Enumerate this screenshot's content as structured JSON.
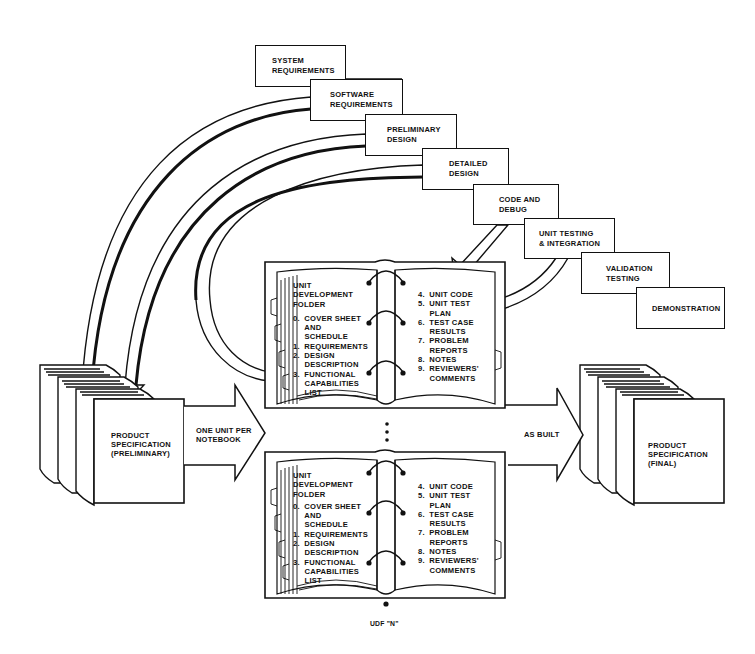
{
  "phases": [
    {
      "id": "system-requirements",
      "line1": "SYSTEM",
      "line2": "REQUIREMENTS"
    },
    {
      "id": "software-requirements",
      "line1": "SOFTWARE",
      "line2": "REQUIREMENTS"
    },
    {
      "id": "preliminary-design",
      "line1": "PRELIMINARY",
      "line2": "DESIGN"
    },
    {
      "id": "detailed-design",
      "line1": "DETAILED",
      "line2": "DESIGN"
    },
    {
      "id": "code-and-debug",
      "line1": "CODE AND",
      "line2": "DEBUG"
    },
    {
      "id": "unit-testing-integration",
      "line1": "UNIT TESTING",
      "line2": "& INTEGRATION"
    },
    {
      "id": "validation-testing",
      "line1": "VALIDATION",
      "line2": "TESTING"
    },
    {
      "id": "demonstration",
      "line1": "DEMONSTRATION",
      "line2": ""
    }
  ],
  "product_spec_preliminary": {
    "line1": "PRODUCT",
    "line2": "SPECIFICATION",
    "line3": "(PRELIMINARY)"
  },
  "product_spec_final": {
    "line1": "PRODUCT",
    "line2": "SPECIFICATION",
    "line3": "(FINAL)"
  },
  "arrows": {
    "left_label_line1": "ONE UNIT PER",
    "left_label_line2": "NOTEBOOK",
    "right_label": "AS BUILT"
  },
  "udf": {
    "title_lines": [
      "UNIT",
      "DEVELOPMENT",
      "FOLDER"
    ],
    "left_items": [
      "0.  COVER SHEET",
      "     AND",
      "     SCHEDULE",
      "1.  REQUIREMENTS",
      "2.  DESIGN",
      "     DESCRIPTION",
      "3.  FUNCTIONAL",
      "     CAPABILITIES",
      "     LIST"
    ],
    "right_items": [
      "4.  UNIT CODE",
      "5.  UNIT TEST",
      "     PLAN",
      "6.  TEST CASE",
      "     RESULTS",
      "7.  PROBLEM",
      "     REPORTS",
      "8.  NOTES",
      "9.  REVIEWERS'",
      "     COMMENTS"
    ],
    "ellipsis": "⋮",
    "last_label": "UDF \"N\""
  },
  "colors": {
    "ink": "#111111",
    "paper": "#ffffff"
  }
}
